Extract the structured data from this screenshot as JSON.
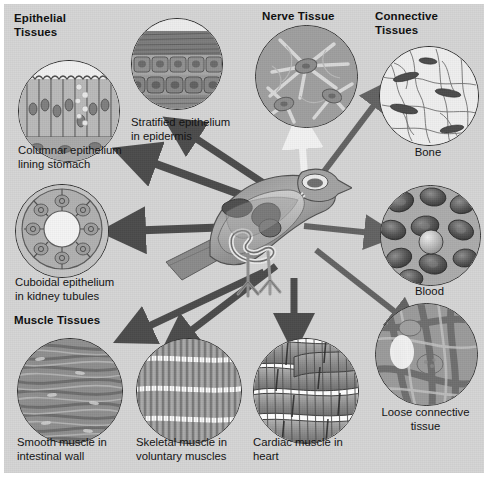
{
  "figure": {
    "background_color": "#d4d4d4",
    "border_color": "#ffffff",
    "arrow_color": "#4a4a4a",
    "nerve_arrow_color": "#f2f2f2",
    "center_label": "bird-anatomy-cutaway"
  },
  "headings": [
    {
      "id": "epithelial",
      "text": "Epithelial\nTissues",
      "x": 10,
      "y": 8
    },
    {
      "id": "nerve",
      "text": "Nerve Tissue",
      "x": 258,
      "y": 6
    },
    {
      "id": "connective",
      "text": "Connective\nTissues",
      "x": 371,
      "y": 6
    },
    {
      "id": "muscle",
      "text": "Muscle Tissues",
      "x": 10,
      "y": 310
    }
  ],
  "micrographs": [
    {
      "id": "columnar-epithelium",
      "caption": "Columnar epithelium\nlining stomach",
      "group": "Epithelial Tissues",
      "circle": {
        "x": 14,
        "y": 56,
        "d": 100
      },
      "caption_pos": {
        "x": 14,
        "y": 140,
        "align": "left"
      },
      "pattern": "columnar"
    },
    {
      "id": "stratified-epithelium",
      "caption": "Stratified epithelium\nin epidermis",
      "group": "Epithelial Tissues",
      "circle": {
        "x": 127,
        "y": 14,
        "d": 90
      },
      "caption_pos": {
        "x": 127,
        "y": 112,
        "align": "left"
      },
      "pattern": "stratified"
    },
    {
      "id": "cuboidal-epithelium",
      "caption": "Cuboidal epithelium\nin kidney tubules",
      "group": "Epithelial Tissues",
      "circle": {
        "x": 11,
        "y": 180,
        "d": 92
      },
      "caption_pos": {
        "x": 11,
        "y": 272,
        "align": "left"
      },
      "pattern": "cuboidal"
    },
    {
      "id": "nerve-tissue",
      "caption": "",
      "group": "Nerve Tissue",
      "circle": {
        "x": 251,
        "y": 21,
        "d": 101
      },
      "caption_pos": {
        "x": 0,
        "y": 0,
        "align": "left"
      },
      "pattern": "nerve"
    },
    {
      "id": "bone",
      "caption": "Bone",
      "group": "Connective Tissues",
      "circle": {
        "x": 375,
        "y": 42,
        "d": 98
      },
      "caption_pos": {
        "x": 375,
        "y": 142,
        "align": "center"
      },
      "pattern": "bone"
    },
    {
      "id": "blood",
      "caption": "Blood",
      "group": "Connective Tissues",
      "circle": {
        "x": 376,
        "y": 181,
        "d": 99
      },
      "caption_pos": {
        "x": 376,
        "y": 281,
        "align": "center"
      },
      "pattern": "blood"
    },
    {
      "id": "loose-connective-tissue",
      "caption": "Loose connective\ntissue",
      "group": "Connective Tissues",
      "circle": {
        "x": 371,
        "y": 299,
        "d": 101
      },
      "caption_pos": {
        "x": 371,
        "y": 402,
        "align": "center"
      },
      "pattern": "loose"
    },
    {
      "id": "smooth-muscle",
      "caption": "Smooth muscle in\nintestinal wall",
      "group": "Muscle Tissues",
      "circle": {
        "x": 13,
        "y": 334,
        "d": 104
      },
      "caption_pos": {
        "x": 13,
        "y": 432,
        "align": "left"
      },
      "pattern": "smooth"
    },
    {
      "id": "skeletal-muscle",
      "caption": "Skeletal muscle in\nvoluntary muscles",
      "group": "Muscle Tissues",
      "circle": {
        "x": 132,
        "y": 334,
        "d": 104
      },
      "caption_pos": {
        "x": 132,
        "y": 432,
        "align": "left"
      },
      "pattern": "skeletal"
    },
    {
      "id": "cardiac-muscle",
      "caption": "Cardiac muscle in\nheart",
      "group": "Muscle Tissues",
      "circle": {
        "x": 249,
        "y": 334,
        "d": 104
      },
      "caption_pos": {
        "x": 249,
        "y": 432,
        "align": "left"
      },
      "pattern": "cardiac"
    }
  ]
}
